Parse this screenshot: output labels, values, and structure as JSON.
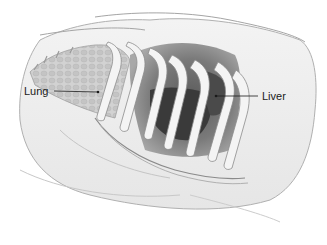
{
  "figure": {
    "type": "anatomical-illustration",
    "palette": {
      "background": "#ffffff",
      "outline": "#8a8a8a",
      "skin_light": "#efefef",
      "skin_shadow": "#d9d9d9",
      "lung_fill": "#cfcfcf",
      "rib_fill": "#f4f4f4",
      "liver_dark": "#3a3a3a",
      "cavity_mid": "#7d7d7d",
      "label_text": "#1a1a1a"
    },
    "labels": [
      {
        "id": "lung",
        "text": "Lung",
        "pointer_to": "lung region"
      },
      {
        "id": "liver",
        "text": "Liver",
        "pointer_to": "liver region"
      }
    ]
  }
}
